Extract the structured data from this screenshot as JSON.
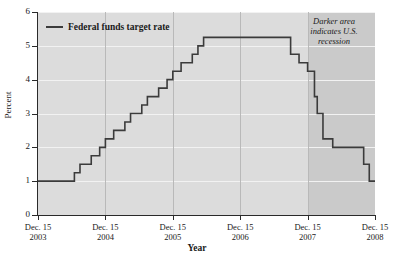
{
  "chart_data": {
    "type": "line",
    "title": "",
    "xlabel": "Year",
    "ylabel": "Percent",
    "xlim": [
      2003.958,
      2008.958
    ],
    "ylim": [
      0,
      6
    ],
    "grid": true,
    "legend_position": "top-left",
    "legend": [
      "Federal funds target rate"
    ],
    "xtick_labels": [
      {
        "date": "Dec. 15",
        "year": "2003"
      },
      {
        "date": "Dec. 15",
        "year": "2004"
      },
      {
        "date": "Dec. 15",
        "year": "2005"
      },
      {
        "date": "Dec. 15",
        "year": "2006"
      },
      {
        "date": "Dec. 15",
        "year": "2007"
      },
      {
        "date": "Dec. 15",
        "year": "2008"
      }
    ],
    "ytick_labels": [
      "0",
      "1",
      "2",
      "3",
      "4",
      "5",
      "6"
    ],
    "annotation": "Darker area indicates U.S. recession",
    "shaded_region": {
      "label": "U.S. recession",
      "start": 2007.958,
      "end": 2008.958,
      "color": "#cacaca"
    },
    "series": [
      {
        "name": "Federal funds target rate",
        "color": "#3b3b3b",
        "step": "post",
        "points": [
          {
            "x": 2003.958,
            "y": 1.0
          },
          {
            "x": 2004.498,
            "y": 1.25
          },
          {
            "x": 2004.581,
            "y": 1.5
          },
          {
            "x": 2004.748,
            "y": 1.75
          },
          {
            "x": 2004.873,
            "y": 2.0
          },
          {
            "x": 2004.958,
            "y": 2.25
          },
          {
            "x": 2005.081,
            "y": 2.5
          },
          {
            "x": 2005.247,
            "y": 2.75
          },
          {
            "x": 2005.331,
            "y": 3.0
          },
          {
            "x": 2005.498,
            "y": 3.25
          },
          {
            "x": 2005.581,
            "y": 3.5
          },
          {
            "x": 2005.748,
            "y": 3.75
          },
          {
            "x": 2005.873,
            "y": 4.0
          },
          {
            "x": 2005.958,
            "y": 4.25
          },
          {
            "x": 2006.081,
            "y": 4.5
          },
          {
            "x": 2006.247,
            "y": 4.75
          },
          {
            "x": 2006.331,
            "y": 5.0
          },
          {
            "x": 2006.415,
            "y": 5.25
          },
          {
            "x": 2007.706,
            "y": 4.75
          },
          {
            "x": 2007.831,
            "y": 4.5
          },
          {
            "x": 2007.958,
            "y": 4.25
          },
          {
            "x": 2008.06,
            "y": 3.5
          },
          {
            "x": 2008.101,
            "y": 3.0
          },
          {
            "x": 2008.186,
            "y": 2.25
          },
          {
            "x": 2008.331,
            "y": 2.0
          },
          {
            "x": 2008.79,
            "y": 1.5
          },
          {
            "x": 2008.873,
            "y": 1.0
          },
          {
            "x": 2008.958,
            "y": 1.0
          }
        ]
      }
    ]
  },
  "axes": {
    "y_title": "Percent",
    "x_title": "Year"
  },
  "legend": {
    "entry_label": "Federal funds target rate"
  },
  "annotation": {
    "line1": "Darker area",
    "line2": "indicates U.S.",
    "line3": "recession"
  },
  "colors": {
    "plot_background": "#dcdcdc",
    "recession_background": "#cacaca",
    "series": "#3b3b3b",
    "gridline": "#f2f2f2",
    "axis": "#2a2a2a"
  }
}
